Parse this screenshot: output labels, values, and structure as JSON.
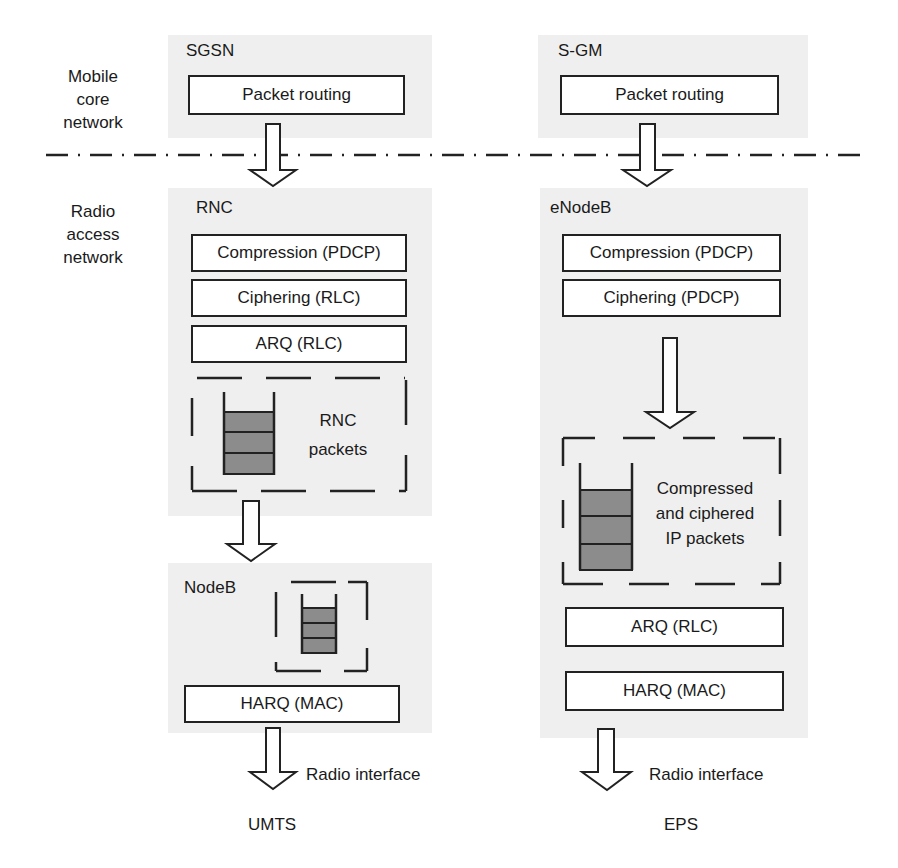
{
  "side_labels": {
    "core": "Mobile\ncore\nnetwork",
    "core_lines": [
      "Mobile",
      "core",
      "network"
    ],
    "ran_lines": [
      "Radio",
      "access",
      "network"
    ]
  },
  "umts": {
    "core_node": {
      "name": "SGSN",
      "functions": [
        "Packet routing"
      ]
    },
    "rnc": {
      "name": "RNC",
      "functions": [
        "Compression (PDCP)",
        "Ciphering (RLC)",
        "ARQ (RLC)"
      ],
      "queue_label_lines": [
        "RNC",
        "packets"
      ],
      "queue_slots": 3
    },
    "nodeb": {
      "name": "NodeB",
      "queue_slots": 3,
      "functions": [
        "HARQ (MAC)"
      ]
    },
    "radio_interface": "Radio interface",
    "caption": "UMTS"
  },
  "eps": {
    "core_node": {
      "name": "S-GM",
      "functions": [
        "Packet routing"
      ]
    },
    "enodeb": {
      "name": "eNodeB",
      "functions_top": [
        "Compression (PDCP)",
        "Ciphering (PDCP)"
      ],
      "queue_label_lines": [
        "Compressed",
        "and ciphered",
        "IP packets"
      ],
      "queue_slots": 3,
      "functions_bottom": [
        "ARQ (RLC)",
        "HARQ (MAC)"
      ]
    },
    "radio_interface": "Radio interface",
    "caption": "EPS"
  },
  "colors": {
    "panel_bg": "#efefef",
    "queue_fill": "#8c8c8c",
    "stroke": "#222222"
  }
}
